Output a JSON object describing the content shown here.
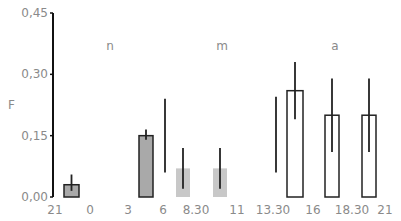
{
  "chart_data": {
    "type": "bar",
    "title": "",
    "ylabel": "F",
    "xlabel": "",
    "ylim": [
      0,
      0.45
    ],
    "yticks": [
      "0,00",
      "0,15",
      "0,30",
      "0,45"
    ],
    "xticks": [
      "21",
      "0",
      "3",
      "6",
      "8.30",
      "11",
      "13.30",
      "16",
      "18.30",
      "21"
    ],
    "period_labels": [
      {
        "label": "n",
        "x": 110
      },
      {
        "label": "m",
        "x": 222
      },
      {
        "label": "a",
        "x": 335
      }
    ],
    "bars": [
      {
        "interval": "21-0",
        "value": 0.03,
        "err_low": 0.015,
        "err_high": 0.055,
        "style": "dark"
      },
      {
        "interval": "3-6",
        "value": 0.15,
        "err_low": 0.14,
        "err_high": 0.165,
        "style": "dark"
      },
      {
        "interval": "8.30",
        "value": 0.07,
        "err_low": 0.02,
        "err_high": 0.12,
        "style": "light"
      },
      {
        "interval": "11",
        "value": 0.07,
        "err_low": 0.02,
        "err_high": 0.12,
        "style": "light"
      },
      {
        "interval": "13.30-16",
        "value": 0.26,
        "err_low": 0.19,
        "err_high": 0.33,
        "style": "open"
      },
      {
        "interval": "16-18.30",
        "value": 0.2,
        "err_low": 0.11,
        "err_high": 0.29,
        "style": "open"
      },
      {
        "interval": "18.30-21",
        "value": 0.2,
        "err_low": 0.11,
        "err_high": 0.29,
        "style": "open"
      }
    ],
    "ranges": [
      {
        "near": "6",
        "low": 0.06,
        "high": 0.24
      },
      {
        "near": "13.30",
        "low": 0.06,
        "high": 0.245
      }
    ],
    "grid": false,
    "legend": null
  },
  "colors": {
    "axis": "#111111",
    "text": "#8a8a8a",
    "dark_bar": "#a9a9a9",
    "light_bar": "#c8c8c8",
    "open_bar": "#ffffff",
    "stroke": "#222222"
  }
}
